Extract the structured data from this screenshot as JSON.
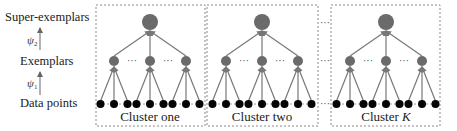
{
  "levels": {
    "super": {
      "label": "Super-exemplars",
      "y": 22
    },
    "exemplar": {
      "label": "Exemplars",
      "y": 61
    },
    "data": {
      "label": "Data points",
      "y": 104
    }
  },
  "mappings": [
    {
      "symbol": "ψ",
      "subscript": "2",
      "from": "exemplar",
      "to": "super"
    },
    {
      "symbol": "ψ",
      "subscript": "1",
      "from": "data",
      "to": "exemplar"
    }
  ],
  "ellipsis": "···",
  "colors": {
    "node_fill": "#6b6b6b",
    "data_fill": "#050505",
    "edge": "#777777",
    "box_border": "#8a8a8a"
  },
  "clusters": [
    {
      "caption": "Cluster one",
      "caption_italic_part": "",
      "box": [
        96,
        5,
        205,
        126
      ],
      "center": 150
    },
    {
      "caption": "Cluster two",
      "caption_italic_part": "",
      "box": [
        207,
        5,
        318,
        126
      ],
      "center": 262
    },
    {
      "caption": "Cluster ",
      "caption_italic_part": "K",
      "box": [
        331,
        5,
        440,
        126
      ],
      "center": 386
    }
  ]
}
